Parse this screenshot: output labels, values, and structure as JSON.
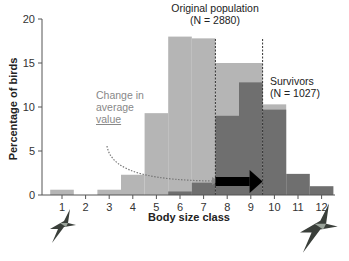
{
  "chart_data": {
    "type": "bar",
    "title": "",
    "xlabel": "Body size class",
    "ylabel": "Percentage of birds",
    "ylim": [
      0,
      20
    ],
    "yticks": [
      0,
      5,
      10,
      15,
      20
    ],
    "categories": [
      "1",
      "2",
      "3",
      "4",
      "5",
      "6",
      "7",
      "8",
      "9",
      "10",
      "11",
      "12"
    ],
    "series": [
      {
        "name": "Original population (N = 2880)",
        "color": "#b5b5b5",
        "values": [
          0.6,
          0,
          0.6,
          2.3,
          9.3,
          18.0,
          17.8,
          15.0,
          15.0,
          10.3,
          0,
          0
        ]
      },
      {
        "name": "Survivors (N = 1027)",
        "color": "#6f6f6f",
        "values": [
          0,
          0,
          0,
          0,
          0,
          0.4,
          1.4,
          9.0,
          12.8,
          9.7,
          2.4,
          1.0
        ]
      }
    ],
    "annotations": [
      {
        "text": "Original population",
        "sub": "(N = 2880)"
      },
      {
        "text": "Survivors",
        "sub": "(N = 1027)"
      },
      {
        "text": "Change in average value"
      }
    ],
    "mean_lines": [
      7.5,
      9.5
    ],
    "grid": false,
    "legend": "none (inline annotations)"
  },
  "labels": {
    "orig_title": "Original population",
    "orig_n": "(N = 2880)",
    "surv_title": "Survivors",
    "surv_n": "(N = 1027)",
    "change_l1": "Change in",
    "change_l2": "average",
    "change_l3": "value",
    "xlabel": "Body size class",
    "ylabel": "Percentage of birds"
  },
  "icons": [
    "small-bird-icon",
    "large-bird-icon"
  ]
}
